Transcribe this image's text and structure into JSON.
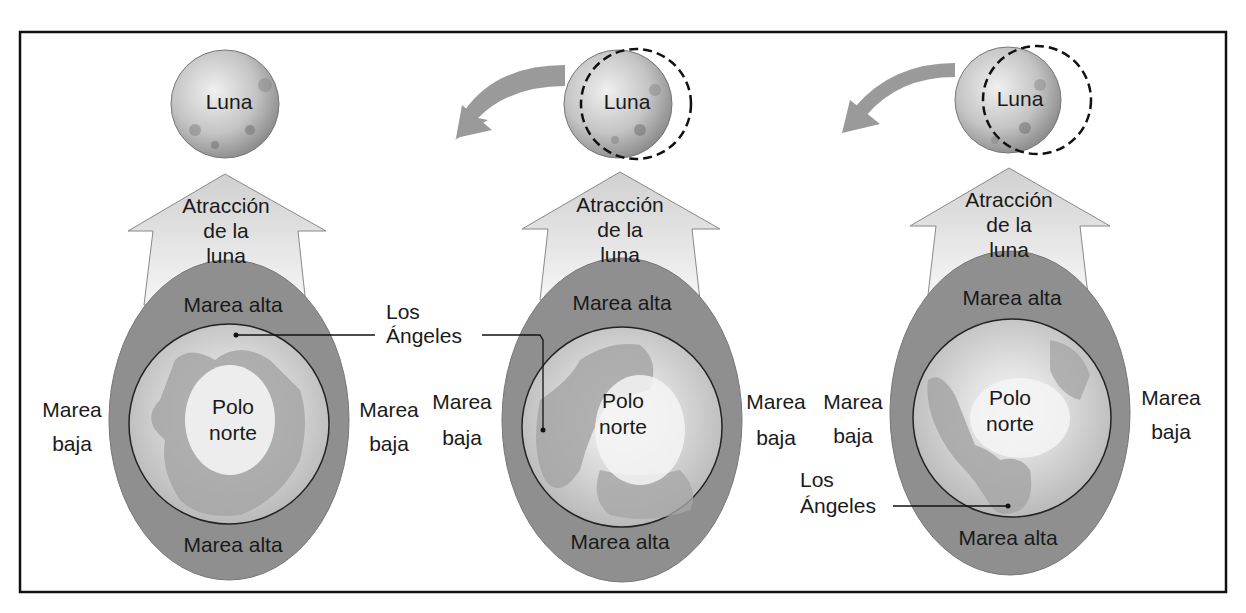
{
  "figure": {
    "frame_color": "#111111",
    "colors": {
      "tide_bulge": "#8f8f8f",
      "earth_ocean": "#a9a9a9",
      "earth_land": "#d6d6d6",
      "polar_ice": "#f2f2f2",
      "attraction_arrow": "#e4e4e4",
      "orbit_arrow": "#9a9a9a",
      "moon": "#c8c8c8"
    },
    "panels": [
      {
        "moon_label": "Luna",
        "attraction_label": [
          "Atracción",
          "de la",
          "luna"
        ],
        "tide_top": "Marea alta",
        "tide_bottom": "Marea alta",
        "tide_left": [
          "Marea",
          "baja"
        ],
        "tide_right": [
          "Marea",
          "baja"
        ],
        "center_label": [
          "Polo",
          "norte"
        ],
        "orbit_arrow": false,
        "dashed_moon_outline": false
      },
      {
        "moon_label": "Luna",
        "attraction_label": [
          "Atracción",
          "de la",
          "luna"
        ],
        "tide_top": "Marea alta",
        "tide_bottom": "Marea alta",
        "tide_left": [
          "Marea",
          "baja"
        ],
        "tide_right": [
          "Marea",
          "baja"
        ],
        "center_label": [
          "Polo",
          "norte"
        ],
        "orbit_arrow": true,
        "dashed_moon_outline": true
      },
      {
        "moon_label": "Luna",
        "attraction_label": [
          "Atracción",
          "de la",
          "luna"
        ],
        "tide_top": "Marea alta",
        "tide_bottom": "Marea alta",
        "tide_left": [
          "Marea",
          "baja"
        ],
        "tide_right": [
          "Marea",
          "baja"
        ],
        "center_label": [
          "Polo",
          "norte"
        ],
        "orbit_arrow": true,
        "dashed_moon_outline": true
      }
    ],
    "callouts": [
      {
        "label": [
          "Los",
          "Ángeles"
        ],
        "points_to": "panel-1-location"
      },
      {
        "label": [
          "Los",
          "Ángeles"
        ],
        "points_to": "panel-3-location"
      }
    ]
  }
}
